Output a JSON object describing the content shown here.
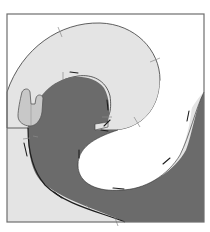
{
  "diagram": {
    "type": "quilt-block-pattern",
    "frame": {
      "x": 7,
      "y": 14,
      "width": 197,
      "height": 208,
      "stroke": "#6e6e6e"
    },
    "colors": {
      "background": "#ffffff",
      "light_fabric": "#e4e4e4",
      "dark_fabric": "#6b6b6b",
      "white_fabric": "#ffffff",
      "hand_piece": "#c8c8c8",
      "outline": "#3a3a3a",
      "tick_marks": "#8a8a8a",
      "stitch_dashes": "#1e1e1e"
    },
    "regions": [
      {
        "name": "light-outer-curl",
        "fill": "light_fabric"
      },
      {
        "name": "dark-inner-wave",
        "fill": "dark_fabric"
      },
      {
        "name": "white-center-swirl",
        "fill": "white_fabric"
      },
      {
        "name": "dark-right-wave",
        "fill": "dark_fabric"
      },
      {
        "name": "hand-shaped-piece",
        "fill": "hand_piece"
      }
    ],
    "marks": {
      "stitch_dash_count": 14,
      "tick_mark_count": 9
    }
  }
}
